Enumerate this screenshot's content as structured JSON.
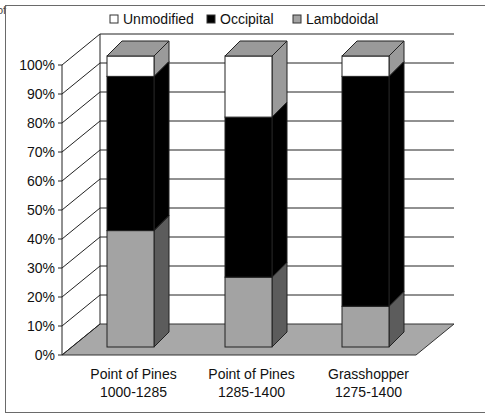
{
  "stray_text": "of",
  "chart_data": {
    "type": "bar",
    "stacked": true,
    "percent": true,
    "three_d": true,
    "title": "",
    "xlabel": "",
    "ylabel": "",
    "ylim": [
      0,
      100
    ],
    "y_ticks": [
      "0%",
      "10%",
      "20%",
      "30%",
      "40%",
      "50%",
      "60%",
      "70%",
      "80%",
      "90%",
      "100%"
    ],
    "grid": true,
    "legend_position": "top",
    "categories": [
      [
        "Point of Pines",
        "1000-1285"
      ],
      [
        "Point of Pines",
        "1285-1400"
      ],
      [
        "Grasshopper",
        "1275-1400"
      ]
    ],
    "series": [
      {
        "name": "Lambdoidal",
        "color": "#a3a3a3",
        "side": "#5c5c5c",
        "top": "#9a9a9a",
        "values": [
          40,
          24,
          14
        ]
      },
      {
        "name": "Occipital",
        "color": "#000000",
        "side": "#000000",
        "top": "#000000",
        "values": [
          53,
          55,
          79
        ]
      },
      {
        "name": "Unmodified",
        "color": "#ffffff",
        "side": "#9a9a9a",
        "top": "#9a9a9a",
        "values": [
          7,
          21,
          7
        ]
      }
    ],
    "legend": [
      {
        "label": "Unmodified",
        "color": "#ffffff"
      },
      {
        "label": "Occipital",
        "color": "#000000"
      },
      {
        "label": "Lambdoidal",
        "color": "#a3a3a3"
      }
    ],
    "floor_color": "#a8a8a8"
  }
}
